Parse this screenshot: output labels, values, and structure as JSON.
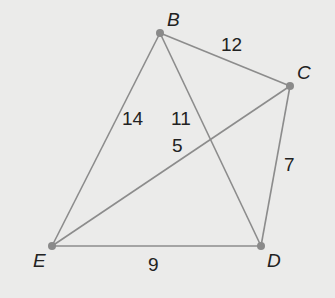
{
  "diagram": {
    "type": "weighted-graph",
    "colors": {
      "background": "#ebebea",
      "edge": "#8c8c8c",
      "vertex": "#8a8a8a",
      "text": "#222222"
    },
    "vertices": [
      {
        "id": "B",
        "label": "B",
        "x": 160,
        "y": 33,
        "lx": 167,
        "ly": 26
      },
      {
        "id": "C",
        "label": "C",
        "x": 290,
        "y": 86,
        "lx": 297,
        "ly": 79
      },
      {
        "id": "D",
        "label": "D",
        "x": 261,
        "y": 246,
        "lx": 267,
        "ly": 267
      },
      {
        "id": "E",
        "label": "E",
        "x": 52,
        "y": 246,
        "lx": 33,
        "ly": 267
      }
    ],
    "edges": [
      {
        "from": "B",
        "to": "C",
        "weight": "12",
        "lx": 221,
        "ly": 51
      },
      {
        "from": "B",
        "to": "E",
        "weight": "14",
        "lx": 122,
        "ly": 125
      },
      {
        "from": "B",
        "to": "D",
        "weight": "11",
        "lx": 171,
        "ly": 125
      },
      {
        "from": "C",
        "to": "E",
        "weight": "5",
        "lx": 172,
        "ly": 152
      },
      {
        "from": "C",
        "to": "D",
        "weight": "7",
        "lx": 284,
        "ly": 171
      },
      {
        "from": "E",
        "to": "D",
        "weight": "9",
        "lx": 148,
        "ly": 271
      }
    ]
  }
}
